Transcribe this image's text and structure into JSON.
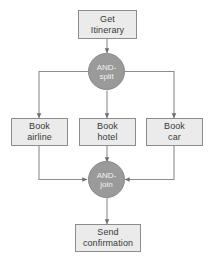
{
  "diagram": {
    "type": "flowchart",
    "title": "",
    "style": {
      "box_fill": "#ebebeb",
      "box_border": "#8c8c8c",
      "circle_fill": "#9a9a9a",
      "circle_border": "#8a8a8a",
      "box_text_color": "#3a3a3a",
      "circle_text_color": "#f2f2f2",
      "connector_color": "#8c8c8c",
      "background": "#ffffff"
    },
    "nodes": [
      {
        "id": "get-itinerary",
        "shape": "rectangle",
        "label": "Get\nItinerary"
      },
      {
        "id": "and-split",
        "shape": "circle",
        "label": "AND-\nsplit"
      },
      {
        "id": "book-airline",
        "shape": "rectangle",
        "label": "Book\nairline"
      },
      {
        "id": "book-hotel",
        "shape": "rectangle",
        "label": "Book\nhotel"
      },
      {
        "id": "book-car",
        "shape": "rectangle",
        "label": "Book\ncar"
      },
      {
        "id": "and-join",
        "shape": "circle",
        "label": "AND-\njoin"
      },
      {
        "id": "send-confirmation",
        "shape": "rectangle",
        "label": "Send\nconfirmation"
      }
    ],
    "edges": [
      {
        "from": "get-itinerary",
        "to": "and-split"
      },
      {
        "from": "and-split",
        "to": "book-airline"
      },
      {
        "from": "and-split",
        "to": "book-hotel"
      },
      {
        "from": "and-split",
        "to": "book-car"
      },
      {
        "from": "book-airline",
        "to": "and-join"
      },
      {
        "from": "book-hotel",
        "to": "and-join"
      },
      {
        "from": "book-car",
        "to": "and-join"
      },
      {
        "from": "and-join",
        "to": "send-confirmation"
      }
    ]
  }
}
